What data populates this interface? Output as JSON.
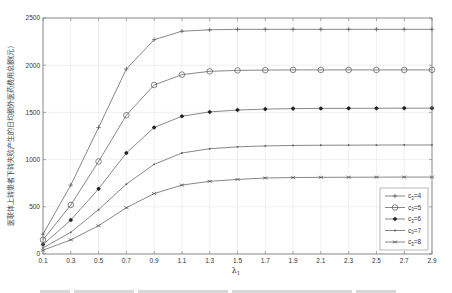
{
  "chart_data": {
    "type": "line",
    "title": "",
    "xlabel": "λ1",
    "ylabel": "医联体上转患者下转失败产生的日均额外医药费用总额(元)",
    "x": [
      0.1,
      0.3,
      0.5,
      0.7,
      0.9,
      1.1,
      1.3,
      1.5,
      1.7,
      1.9,
      2.1,
      2.3,
      2.5,
      2.7,
      2.9
    ],
    "xticks": [
      "0.1",
      "0.3",
      "0.5",
      "0.7",
      "0.9",
      "1.1",
      "1.3",
      "1.5",
      "1.7",
      "1.9",
      "2.1",
      "2.3",
      "2.5",
      "2.7",
      "2.9"
    ],
    "xlim": [
      0.1,
      2.9
    ],
    "yticks": [
      "0",
      "500",
      "1000",
      "1500",
      "2000",
      "2500"
    ],
    "ylim": [
      0,
      2500
    ],
    "grid": true,
    "legend_position": "lower right",
    "series": [
      {
        "name": "c3=4",
        "marker": "plus",
        "values": [
          210,
          730,
          1340,
          1960,
          2270,
          2360,
          2375,
          2380,
          2380,
          2380,
          2380,
          2380,
          2380,
          2380,
          2380
        ]
      },
      {
        "name": "c3=5",
        "marker": "circle",
        "values": [
          150,
          520,
          980,
          1470,
          1790,
          1900,
          1935,
          1945,
          1948,
          1950,
          1950,
          1950,
          1950,
          1950,
          1950
        ]
      },
      {
        "name": "c3=6",
        "marker": "star",
        "values": [
          100,
          360,
          690,
          1070,
          1340,
          1460,
          1505,
          1525,
          1535,
          1540,
          1542,
          1543,
          1544,
          1545,
          1545
        ]
      },
      {
        "name": "c3=7",
        "marker": "point",
        "values": [
          65,
          230,
          470,
          740,
          950,
          1070,
          1115,
          1135,
          1145,
          1150,
          1152,
          1153,
          1154,
          1155,
          1155
        ]
      },
      {
        "name": "c3=8",
        "marker": "x",
        "values": [
          40,
          150,
          300,
          490,
          640,
          730,
          770,
          790,
          805,
          810,
          812,
          813,
          814,
          815,
          815
        ]
      }
    ]
  },
  "legend": {
    "items": [
      {
        "sub": "3",
        "base": "c",
        "val": "=4"
      },
      {
        "sub": "3",
        "base": "c",
        "val": "=5"
      },
      {
        "sub": "3",
        "base": "c",
        "val": "=6"
      },
      {
        "sub": "3",
        "base": "c",
        "val": "=7"
      },
      {
        "sub": "3",
        "base": "c",
        "val": "=8"
      }
    ]
  },
  "axes": {
    "xlabel_main": "λ",
    "xlabel_sub": "1",
    "ylabel": "医联体上转患者下转失败产生的日均额外医药费用总额(元)"
  },
  "colors": {
    "line": "#555555",
    "grid": "#e6e6e6",
    "axis": "#777777"
  }
}
